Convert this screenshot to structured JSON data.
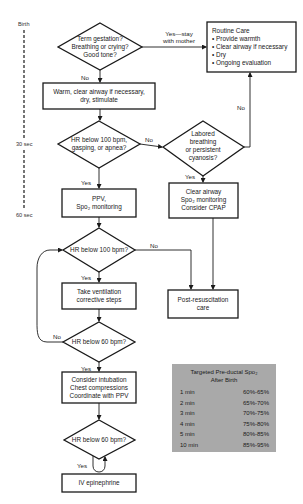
{
  "timeline": {
    "labels": [
      "Birth",
      "30 sec",
      "60 sec"
    ]
  },
  "nodes": {
    "d_term": [
      "Term gestation?",
      "Breathing or crying?",
      "Good tone?"
    ],
    "routine_care": {
      "title": "Routine Care",
      "items": [
        "• Provide warmth",
        "• Clear airway if necessary",
        "• Dry",
        "• Ongoing evaluation"
      ]
    },
    "warm": [
      "Warm, clear airway if necessary,",
      "dry, stimulate"
    ],
    "d_hr100_gasp": [
      "HR below 100 bpm,",
      "gasping, or apnea?"
    ],
    "d_labored": [
      "Labored",
      "breathing",
      "or persistent",
      "cyanosis?"
    ],
    "ppv": [
      "PPV,",
      "Spo₂ monitoring"
    ],
    "clear_airway": [
      "Clear airway",
      "Spo₂ monitoring",
      "Consider CPAP"
    ],
    "d_hr100": [
      "HR below 100 bpm?"
    ],
    "ventilation": [
      "Take ventilation",
      "corrective steps"
    ],
    "post_resus": [
      "Post-resuscitation",
      "care"
    ],
    "d_hr60_a": [
      "HR below 60 bpm?"
    ],
    "intubation": [
      "Consider intubation",
      "Chest compressions",
      "Coordinate with PPV"
    ],
    "d_hr60_b": [
      "HR below 60 bpm?"
    ],
    "epinephrine": [
      "IV epinephrine"
    ]
  },
  "edge_labels": {
    "yes_stay": [
      "Yes—stay",
      "with mother"
    ],
    "no_1": "No",
    "no_2": "No",
    "no_routine": "No",
    "yes_1": "Yes",
    "yes_2": "Yes",
    "no_3": "No",
    "yes_3": "Yes",
    "no_loop": "No",
    "yes_4": "Yes",
    "yes_5": "Yes"
  },
  "spo2_table": {
    "title": [
      "Targeted Pre-ductal Spo₂",
      "After Birth"
    ],
    "rows": [
      {
        "time": "1 min",
        "range": "60%-65%"
      },
      {
        "time": "2 min",
        "range": "65%-70%"
      },
      {
        "time": "3 min",
        "range": "70%-75%"
      },
      {
        "time": "4 min",
        "range": "75%-80%"
      },
      {
        "time": "5 min",
        "range": "80%-85%"
      },
      {
        "time": "10 min",
        "range": "85%-95%"
      }
    ],
    "bg_color": "#a9a9a9"
  }
}
